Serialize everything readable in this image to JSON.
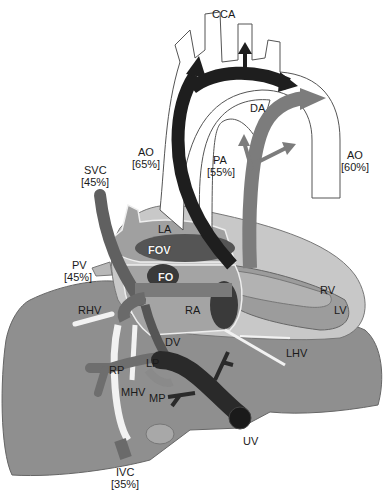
{
  "diagram": {
    "colors": {
      "background": "#ffffff",
      "liver": "#8f8f8f",
      "heart_outer": "#c8c8c8",
      "heart_mid": "#a9a9a9",
      "oxygenated_arrow": "#1e1e1e",
      "umbilical_vein": "#2a2a2a",
      "venous_mid": "#6a6a6a",
      "pa_flow": "#7c7c7c",
      "hepatic_vein": "#f2f2f2",
      "outline": "#444444"
    },
    "labels": {
      "cca": "CCA",
      "da": "DA",
      "ao_asc": "AO",
      "ao_asc_pct": "[65%]",
      "pa": "PA",
      "pa_pct": "[55%]",
      "ao_desc": "AO",
      "ao_desc_pct": "[60%]",
      "svc": "SVC",
      "svc_pct": "[45%]",
      "la": "LA",
      "fov": "FOV",
      "fo": "FO",
      "pv": "PV",
      "pv_pct": "[45%]",
      "rhv": "RHV",
      "ra": "RA",
      "rv": "RV",
      "lv": "LV",
      "dv": "DV",
      "lhv": "LHV",
      "rp": "RP",
      "lp": "LP",
      "mhv": "MHV",
      "mp": "MP",
      "uv": "UV",
      "ivc": "IVC",
      "ivc_pct": "[35%]"
    }
  }
}
